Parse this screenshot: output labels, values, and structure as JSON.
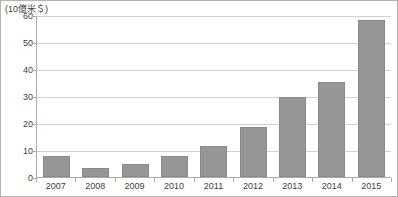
{
  "chart_data": {
    "type": "bar",
    "title": "",
    "subtitle": "",
    "unit_label": "(10億米＄)",
    "xlabel": "",
    "ylabel": "",
    "categories": [
      "2007",
      "2008",
      "2009",
      "2010",
      "2011",
      "2012",
      "2013",
      "2014",
      "2015"
    ],
    "values": [
      7.7,
      3.3,
      4.7,
      7.7,
      11.7,
      18.5,
      30.0,
      35.5,
      58.5
    ],
    "ylim": [
      0,
      60
    ],
    "yticks": [
      0,
      10,
      20,
      30,
      40,
      50,
      60
    ],
    "ytick_labels": [
      "0",
      "10",
      "20",
      "30",
      "40",
      "50",
      "60"
    ],
    "grid": true,
    "legend": false,
    "legend_position": "none",
    "series": [
      {
        "name": "",
        "values": [
          7.7,
          3.3,
          4.7,
          7.7,
          11.7,
          18.5,
          30.0,
          35.5,
          58.5
        ],
        "color": "#969696"
      }
    ]
  },
  "colors": {
    "bar_fill": "#969696",
    "bar_border": "#8a8a8a",
    "gridline": "#d2d2d2",
    "axis": "#aaaaaa",
    "frame_border": "#b4b4b4",
    "text": "#404040",
    "background": "#ffffff"
  }
}
